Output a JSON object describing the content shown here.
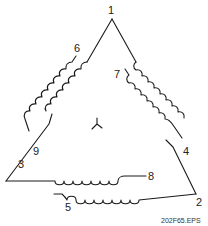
{
  "diagram": {
    "type": "delta-connected motor winding diagram",
    "center_symbol": "wye-symbol",
    "terminals": [
      {
        "id": "t1",
        "label": "1"
      },
      {
        "id": "t2",
        "label": "2"
      },
      {
        "id": "t3",
        "label": "3"
      },
      {
        "id": "t4",
        "label": "4"
      },
      {
        "id": "t5",
        "label": "5"
      },
      {
        "id": "t6",
        "label": "6"
      },
      {
        "id": "t7",
        "label": "7"
      },
      {
        "id": "t8",
        "label": "8"
      },
      {
        "id": "t9",
        "label": "9"
      }
    ],
    "caption": "202F65.EPS"
  }
}
